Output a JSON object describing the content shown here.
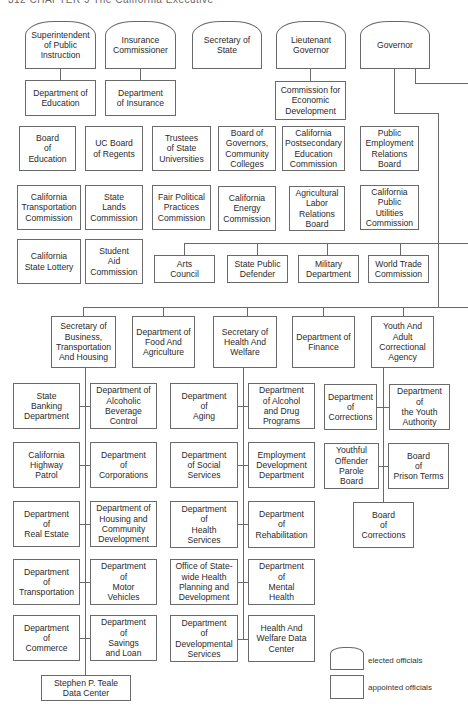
{
  "header": {
    "text": "312   CHAPTER 9      The California Executive"
  },
  "elected": [
    {
      "id": "spi",
      "label": "Superintendent\nof Public\nInstruction",
      "x": 25,
      "y": 21,
      "w": 71,
      "h": 48
    },
    {
      "id": "ins",
      "label": "Insurance\nCommissioner",
      "x": 105,
      "y": 21,
      "w": 71,
      "h": 48
    },
    {
      "id": "sos",
      "label": "Secretary of\nState",
      "x": 192,
      "y": 21,
      "w": 70,
      "h": 48
    },
    {
      "id": "ltg",
      "label": "Lieutenant\nGovernor",
      "x": 276,
      "y": 21,
      "w": 70,
      "h": 48
    },
    {
      "id": "gov",
      "label": "Governor",
      "x": 360,
      "y": 21,
      "w": 70,
      "h": 48
    }
  ],
  "row1": [
    {
      "id": "doe",
      "label": "Department of\nEducation",
      "x": 25,
      "y": 80,
      "w": 71,
      "h": 36
    },
    {
      "id": "doi",
      "label": "Department\nof Insurance",
      "x": 105,
      "y": 80,
      "w": 71,
      "h": 36
    },
    {
      "id": "ced",
      "label": "Commission for\nEconomic\nDevelopment",
      "x": 275,
      "y": 81,
      "w": 71,
      "h": 39
    }
  ],
  "boards": [
    {
      "label": "Board\nof\nEducation",
      "x": 19,
      "y": 126,
      "w": 57,
      "h": 45
    },
    {
      "label": "UC Board\nof Regents",
      "x": 85,
      "y": 126,
      "w": 58,
      "h": 45
    },
    {
      "label": "Trustees\nof State\nUniversities",
      "x": 152,
      "y": 126,
      "w": 59,
      "h": 45
    },
    {
      "label": "Board of\nGovernors,\nCommunity\nColleges",
      "x": 218,
      "y": 126,
      "w": 58,
      "h": 45
    },
    {
      "label": "California\nPostsecondary\nEducation\nCommission",
      "x": 282,
      "y": 126,
      "w": 63,
      "h": 45
    },
    {
      "label": "Public\nEmployment\nRelations\nBoard",
      "x": 360,
      "y": 126,
      "w": 59,
      "h": 45
    },
    {
      "label": "California\nTransportation\nCommission",
      "x": 17,
      "y": 185,
      "w": 64,
      "h": 45
    },
    {
      "label": "State\nLands\nCommission",
      "x": 85,
      "y": 185,
      "w": 58,
      "h": 45
    },
    {
      "label": "Fair Political\nPractices\nCommission",
      "x": 152,
      "y": 185,
      "w": 59,
      "h": 45
    },
    {
      "label": "California\nEnergy\nCommission",
      "x": 218,
      "y": 186,
      "w": 58,
      "h": 45
    },
    {
      "label": "Agricultural\nLabor\nRelations\nBoard",
      "x": 289,
      "y": 186,
      "w": 56,
      "h": 45
    },
    {
      "label": "California\nPublic\nUtilities\nCommission",
      "x": 360,
      "y": 185,
      "w": 59,
      "h": 45
    },
    {
      "label": "California\nState Lottery",
      "x": 17,
      "y": 239,
      "w": 64,
      "h": 45
    },
    {
      "label": "Student\nAid\nCommission",
      "x": 85,
      "y": 239,
      "w": 58,
      "h": 45
    }
  ],
  "gov_units": [
    {
      "label": "Arts\nCouncil",
      "x": 154,
      "y": 255,
      "w": 61,
      "h": 28
    },
    {
      "label": "State Public\nDefender",
      "x": 227,
      "y": 255,
      "w": 61,
      "h": 28
    },
    {
      "label": "Military\nDepartment",
      "x": 298,
      "y": 255,
      "w": 61,
      "h": 28
    },
    {
      "label": "World Trade\nCommission",
      "x": 368,
      "y": 255,
      "w": 61,
      "h": 28
    }
  ],
  "agencies": [
    {
      "label": "Secretary of\nBusiness,\nTransportation\nAnd Housing",
      "x": 51,
      "y": 316,
      "w": 65,
      "h": 52
    },
    {
      "label": "Department of\nFood And\nAgriculture",
      "x": 132,
      "y": 316,
      "w": 63,
      "h": 52
    },
    {
      "label": "Secretary of\nHealth And\nWelfare",
      "x": 213,
      "y": 316,
      "w": 64,
      "h": 52
    },
    {
      "label": "Department of\nFinance",
      "x": 292,
      "y": 316,
      "w": 63,
      "h": 52
    },
    {
      "label": "Youth And\nAdult\nCorrectional\nAgency",
      "x": 371,
      "y": 316,
      "w": 63,
      "h": 52
    }
  ],
  "departments": [
    {
      "label": "State\nBanking\nDepartment",
      "x": 13,
      "y": 383,
      "w": 67,
      "h": 46
    },
    {
      "label": "Department of\nAlcoholic\nBeverage\nControl",
      "x": 90,
      "y": 383,
      "w": 67,
      "h": 46
    },
    {
      "label": "California\nHighway\nPatrol",
      "x": 13,
      "y": 442,
      "w": 67,
      "h": 46
    },
    {
      "label": "Department\nof\nCorporations",
      "x": 90,
      "y": 442,
      "w": 67,
      "h": 46
    },
    {
      "label": "Department\nof\nReal Estate",
      "x": 13,
      "y": 501,
      "w": 67,
      "h": 46
    },
    {
      "label": "Department of\nHousing and\nCommunity\nDevelopment",
      "x": 90,
      "y": 501,
      "w": 67,
      "h": 46
    },
    {
      "label": "Department\nof\nTransportation",
      "x": 13,
      "y": 559,
      "w": 67,
      "h": 46
    },
    {
      "label": "Department\nof\nMotor\nVehicles",
      "x": 90,
      "y": 559,
      "w": 67,
      "h": 46
    },
    {
      "label": "Department\nof\nCommerce",
      "x": 13,
      "y": 615,
      "w": 67,
      "h": 46
    },
    {
      "label": "Department\nof\nSavings\nand Loan",
      "x": 90,
      "y": 615,
      "w": 67,
      "h": 46
    },
    {
      "label": "Stephen P. Teale\nData Center",
      "x": 41,
      "y": 675,
      "w": 90,
      "h": 26
    },
    {
      "label": "Department\nof\nAging",
      "x": 170,
      "y": 383,
      "w": 68,
      "h": 46
    },
    {
      "label": "Department\nof Alcohol\nand Drug\nPrograms",
      "x": 248,
      "y": 383,
      "w": 67,
      "h": 46
    },
    {
      "label": "Department\nof Social\nServices",
      "x": 170,
      "y": 442,
      "w": 68,
      "h": 46
    },
    {
      "label": "Employment\nDevelopment\nDepartment",
      "x": 248,
      "y": 442,
      "w": 67,
      "h": 46
    },
    {
      "label": "Department\nof\nHealth\nServices",
      "x": 170,
      "y": 501,
      "w": 68,
      "h": 47
    },
    {
      "label": "Department\nof\nRehabilitation",
      "x": 248,
      "y": 501,
      "w": 67,
      "h": 47
    },
    {
      "label": "Office of State-\nwide Health\nPlanning and\nDevelopment",
      "x": 170,
      "y": 559,
      "w": 68,
      "h": 46
    },
    {
      "label": "Department\nof\nMental\nHealth",
      "x": 248,
      "y": 559,
      "w": 67,
      "h": 46
    },
    {
      "label": "Department\nof\nDevelopmental\nServices",
      "x": 170,
      "y": 615,
      "w": 68,
      "h": 47
    },
    {
      "label": "Health And\nWelfare Data\nCenter",
      "x": 248,
      "y": 615,
      "w": 67,
      "h": 47
    },
    {
      "label": "Department\nof\nCorrections",
      "x": 324,
      "y": 384,
      "w": 53,
      "h": 46
    },
    {
      "label": "Department\nof\nthe Youth\nAuthority",
      "x": 389,
      "y": 384,
      "w": 61,
      "h": 46
    },
    {
      "label": "Youthful\nOffender\nParole\nBoard",
      "x": 324,
      "y": 443,
      "w": 55,
      "h": 46
    },
    {
      "label": "Board\nof\nPrison Terms",
      "x": 388,
      "y": 443,
      "w": 61,
      "h": 46
    },
    {
      "label": "Board\nof\nCorrections",
      "x": 353,
      "y": 502,
      "w": 61,
      "h": 46
    }
  ],
  "legend": {
    "elected_label": "elected officials",
    "appointed_label": "appointed officials"
  },
  "colors": {
    "line": "#6a6a6a",
    "text": "#2a2a2a",
    "background": "#ffffff"
  }
}
